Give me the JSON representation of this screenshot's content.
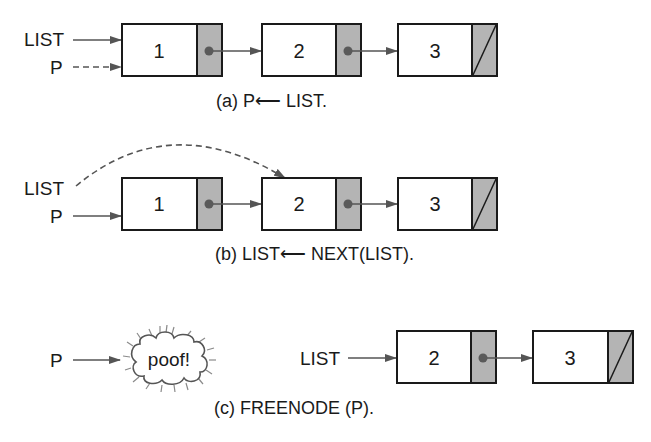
{
  "diagram": {
    "colors": {
      "node_fill": "#ffffff",
      "pointer_fill": "#b4b4b4",
      "outline": "#1a1a1a",
      "arrow": "#555555"
    },
    "panels": [
      {
        "id": "a",
        "caption": "(a) P⟵ LIST.",
        "external_pointers": [
          {
            "label": "LIST",
            "target_node": 0,
            "style": "solid"
          },
          {
            "label": "P",
            "target_node": 0,
            "style": "dashed"
          }
        ],
        "nodes": [
          {
            "value": "1",
            "next": "pointer"
          },
          {
            "value": "2",
            "next": "pointer"
          },
          {
            "value": "3",
            "next": "null"
          }
        ]
      },
      {
        "id": "b",
        "caption": "(b) LIST⟵ NEXT(LIST).",
        "external_pointers": [
          {
            "label": "LIST",
            "target_node": 1,
            "style": "dashed-curved"
          },
          {
            "label": "P",
            "target_node": 0,
            "style": "solid"
          }
        ],
        "nodes": [
          {
            "value": "1",
            "next": "pointer"
          },
          {
            "value": "2",
            "next": "pointer"
          },
          {
            "value": "3",
            "next": "null"
          }
        ]
      },
      {
        "id": "c",
        "caption": "(c) FREENODE (P).",
        "freed": {
          "pointer_label": "P",
          "text": "poof!"
        },
        "external_pointers": [
          {
            "label": "LIST",
            "target_node": 0,
            "style": "solid"
          }
        ],
        "nodes": [
          {
            "value": "2",
            "next": "pointer"
          },
          {
            "value": "3",
            "next": "null"
          }
        ]
      }
    ]
  }
}
